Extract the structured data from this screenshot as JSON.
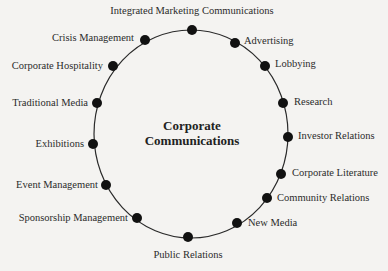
{
  "diagram": {
    "center": {
      "line1": "Corporate",
      "line2": "Communications"
    },
    "ring_color": "#2a2a2a",
    "node_color": "#111111",
    "background": "#f4f3f1",
    "nodes": [
      {
        "label": "Integrated Marketing Communications",
        "x": 192,
        "y": 30
      },
      {
        "label": "Advertising",
        "x": 235,
        "y": 43
      },
      {
        "label": "Lobbying",
        "x": 265,
        "y": 66
      },
      {
        "label": "Research",
        "x": 283,
        "y": 103
      },
      {
        "label": "Investor Relations",
        "x": 288,
        "y": 137
      },
      {
        "label": "Corporate Literature",
        "x": 281,
        "y": 174
      },
      {
        "label": "Community Relations",
        "x": 267,
        "y": 198
      },
      {
        "label": "New Media",
        "x": 237,
        "y": 223
      },
      {
        "label": "Public Relations",
        "x": 188,
        "y": 237
      },
      {
        "label": "Sponsorship Management",
        "x": 137,
        "y": 218
      },
      {
        "label": "Event Management",
        "x": 106,
        "y": 185
      },
      {
        "label": "Exhibitions",
        "x": 93,
        "y": 144
      },
      {
        "label": "Traditional Media",
        "x": 97,
        "y": 103
      },
      {
        "label": "Corporate Hospitality",
        "x": 113,
        "y": 66
      },
      {
        "label": "Crisis Management",
        "x": 145,
        "y": 40
      }
    ]
  }
}
